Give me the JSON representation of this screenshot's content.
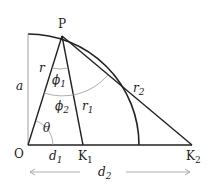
{
  "diagram": {
    "points": {
      "P": {
        "label": "P",
        "x": 62,
        "y": 36
      },
      "O": {
        "label": "O",
        "x": 28,
        "y": 145
      },
      "K1": {
        "label": "K",
        "sub": "1",
        "x": 83,
        "y": 145
      },
      "K2": {
        "label": "K",
        "sub": "2",
        "x": 192,
        "y": 145
      }
    },
    "labels": {
      "a": "a",
      "r": "r",
      "r1": "r",
      "r1_sub": "1",
      "r2": "r",
      "r2_sub": "2",
      "phi1": "ϕ",
      "phi1_sub": "1",
      "phi2": "ϕ",
      "phi2_sub": "2",
      "theta": "θ",
      "d1": "d",
      "d1_sub": "1",
      "d2": "d",
      "d2_sub": "2"
    },
    "colors": {
      "line": "#222222",
      "arc_light": "#999999"
    }
  }
}
